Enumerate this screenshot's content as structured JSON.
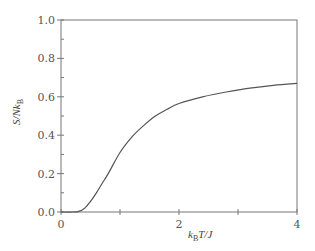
{
  "chart_data": {
    "type": "line",
    "title": "",
    "xlabel": "k_B T / J",
    "ylabel": "S / N k_B",
    "xlim": [
      0,
      4
    ],
    "ylim": [
      0.0,
      1.0
    ],
    "grid": false,
    "legend": null,
    "x_ticks": [
      "0",
      "2",
      "4"
    ],
    "y_ticks": [
      "0.0",
      "0.2",
      "0.4",
      "0.6",
      "0.8",
      "1.0"
    ],
    "series": [
      {
        "name": "entropy",
        "x": [
          0.0,
          0.2,
          0.3,
          0.4,
          0.5,
          0.6,
          0.7,
          0.8,
          1.0,
          1.2,
          1.4,
          1.6,
          1.8,
          2.0,
          2.4,
          2.8,
          3.2,
          3.6,
          4.0
        ],
        "values": [
          0.0,
          0.0,
          0.003,
          0.02,
          0.055,
          0.1,
          0.15,
          0.2,
          0.31,
          0.39,
          0.45,
          0.5,
          0.535,
          0.565,
          0.6,
          0.625,
          0.645,
          0.66,
          0.67
        ]
      }
    ]
  },
  "labels": {
    "x_axis_main": "k",
    "x_axis_sub": "B",
    "x_axis_rest": "T/J",
    "y_axis_main": "S/Nk",
    "y_axis_sub": "B"
  }
}
